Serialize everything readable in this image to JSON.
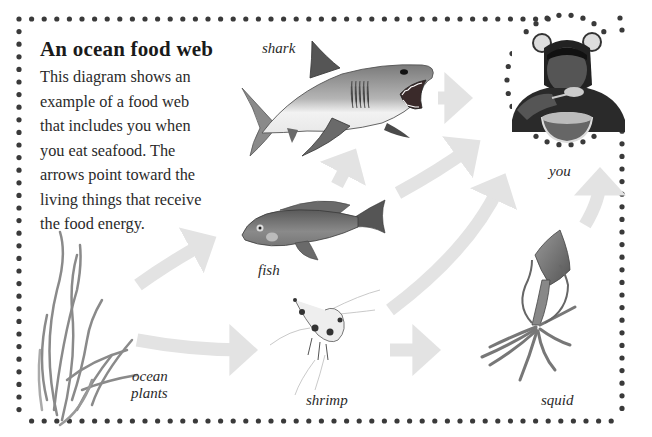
{
  "title": "An ocean food web",
  "description_lines": [
    "This diagram shows an",
    "example of a food web",
    "that includes you when",
    "you eat seafood. The",
    "arrows point toward the",
    "living things that receive",
    "the food energy."
  ],
  "organisms": {
    "shark": {
      "label": "shark",
      "icon": "shark-illustration"
    },
    "you": {
      "label": "you",
      "icon": "child-eating-photo"
    },
    "fish": {
      "label": "fish",
      "icon": "fish-illustration"
    },
    "ocean_plants": {
      "label_line1": "ocean",
      "label_line2": "plants",
      "icon": "seagrass-illustration"
    },
    "shrimp": {
      "label": "shrimp",
      "icon": "shrimp-illustration"
    },
    "squid": {
      "label": "squid",
      "icon": "squid-illustration"
    }
  },
  "arrows": [
    {
      "from": "ocean plants",
      "to": "fish"
    },
    {
      "from": "ocean plants",
      "to": "shrimp"
    },
    {
      "from": "fish",
      "to": "shark"
    },
    {
      "from": "fish",
      "to": "you"
    },
    {
      "from": "shark",
      "to": "you"
    },
    {
      "from": "shrimp",
      "to": "you"
    },
    {
      "from": "shrimp",
      "to": "squid"
    },
    {
      "from": "squid",
      "to": "you"
    }
  ],
  "colors": {
    "border_dots": "#3a3a3a",
    "arrow": "#e4e4e4",
    "text": "#2a2a2a"
  }
}
